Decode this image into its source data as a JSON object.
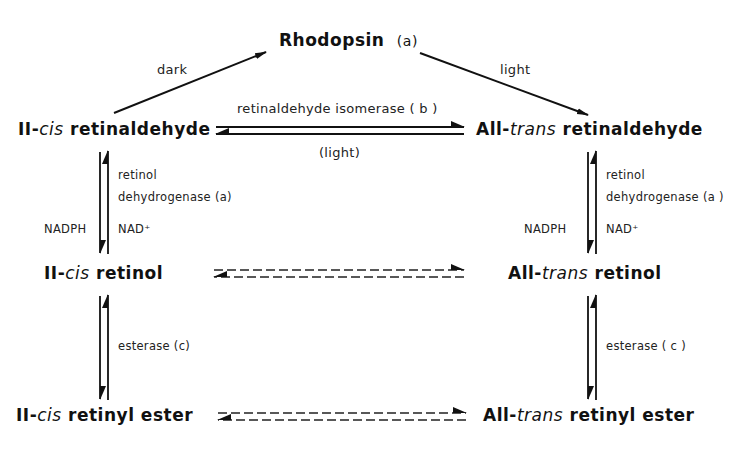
{
  "diagram": {
    "nodes": {
      "rhodopsin": {
        "name": "Rhodopsin",
        "tag": "(a)"
      },
      "cis_retinaldehyde": {
        "prefix": "II-",
        "italic": "cis",
        "suffix": " retinaldehyde"
      },
      "trans_retinaldehyde": {
        "prefix": "All-",
        "italic": "trans",
        "suffix": " retinaldehyde"
      },
      "cis_retinol": {
        "prefix": "II-",
        "italic": "cis",
        "suffix": " retinol"
      },
      "trans_retinol": {
        "prefix": "All-",
        "italic": "trans",
        "suffix": " retinol"
      },
      "cis_retinyl_ester": {
        "prefix": "II-",
        "italic": "cis",
        "suffix": " retinyl ester"
      },
      "trans_retinyl_ester": {
        "prefix": "All-",
        "italic": "trans",
        "suffix": " retinyl ester"
      }
    },
    "edges": {
      "dark": "dark",
      "light_top": "light",
      "isomerase": "retinaldehyde isomerase ( b )",
      "isomerase_reverse": "(light)",
      "left_dehydrogenase_line1": "retinol",
      "left_dehydrogenase_line2": "dehydrogenase (a)",
      "left_cofactor_down": "NADPH",
      "left_cofactor_up": "NAD⁺",
      "right_dehydrogenase_line1": "retinol",
      "right_dehydrogenase_line2": "dehydrogenase (a )",
      "right_cofactor_down": "NADPH",
      "right_cofactor_up": "NAD⁺",
      "left_esterase": "esterase (c)",
      "right_esterase": "esterase ( c )"
    }
  }
}
